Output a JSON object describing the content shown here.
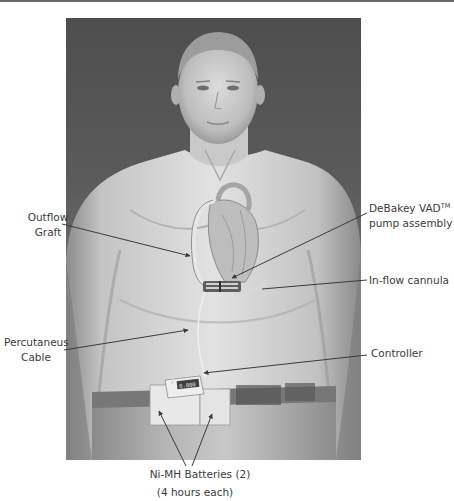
{
  "figure": {
    "colors": {
      "background_top": "#4f4f4f",
      "background_mid": "#6e6e6e",
      "skin_light": "#d8d8d8",
      "leader_line": "#3a3a3a",
      "label_text": "#3a3a3a"
    },
    "labels": {
      "outflow_graft": [
        "Outflow",
        "Graft"
      ],
      "percutaneus_cable": [
        "Percutaneus",
        "Cable"
      ],
      "debakey_pump": {
        "line1_main": "DeBakey VAD",
        "line1_sup": "TM",
        "line2": "pump assembly"
      },
      "inflow_cannula": "In-flow cannula",
      "controller": "Controller",
      "batteries": "Ni-MH Batteries (2)",
      "batteries_note": "(4 hours each)"
    },
    "controller_display": "0.000"
  }
}
